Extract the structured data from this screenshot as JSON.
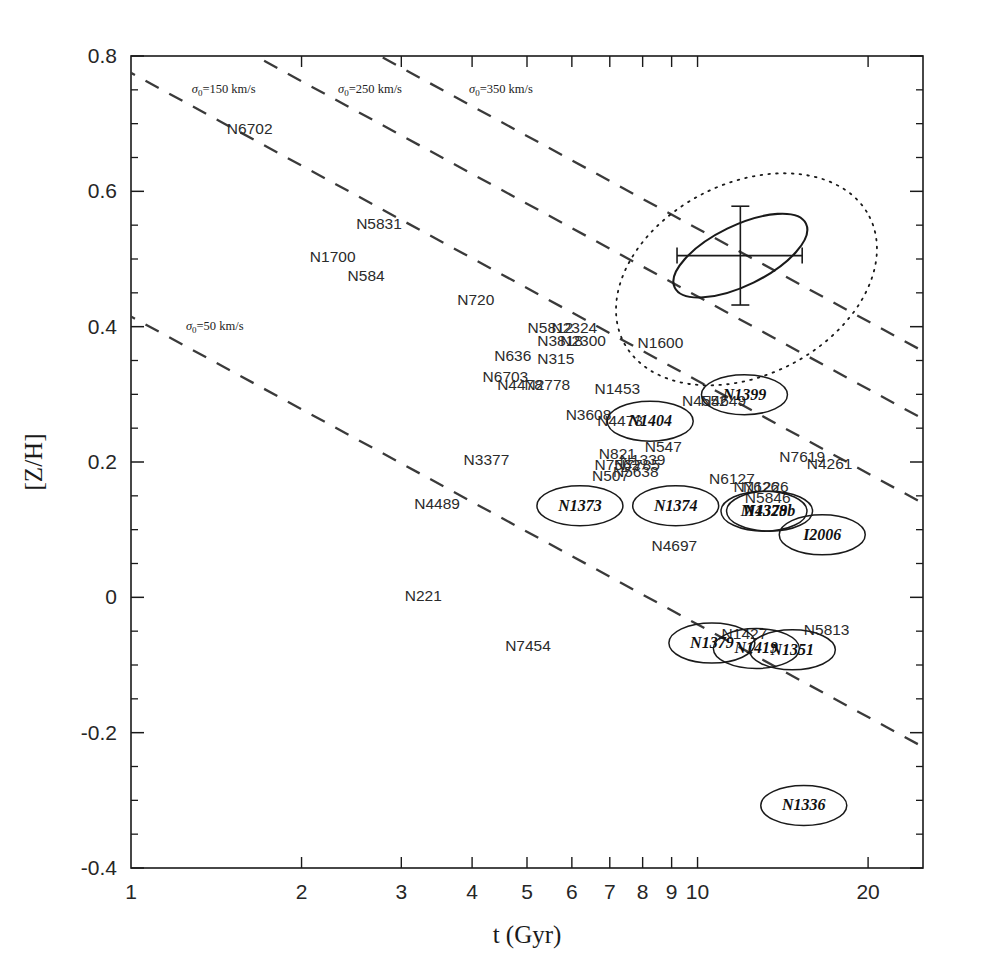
{
  "figure": {
    "domain": "chart",
    "background": "#ffffff",
    "ink": "#1a1a1a"
  },
  "chart_data": {
    "type": "scatter",
    "title": "",
    "xlabel": "t (Gyr)",
    "ylabel": "[Z/H]",
    "xscale": "log",
    "xlim": [
      1,
      25
    ],
    "ylim": [
      -0.4,
      0.8
    ],
    "grid": false,
    "legend": "none",
    "xticks_major": [
      1,
      2,
      3,
      4,
      5,
      6,
      7,
      8,
      9,
      10,
      20
    ],
    "xtick_labels": [
      "1",
      "2",
      "3",
      "4",
      "5",
      "6",
      "7",
      "8",
      "9",
      "10",
      "20"
    ],
    "yticks_major": [
      -0.4,
      -0.2,
      0,
      0.2,
      0.4,
      0.6,
      0.8
    ],
    "ytick_labels": [
      "-0.4",
      "-0.2",
      "0",
      "0.2",
      "0.4",
      "0.6",
      "0.8"
    ],
    "yticks_minor": [
      -0.35,
      -0.3,
      -0.25,
      -0.15,
      -0.1,
      -0.05,
      0.05,
      0.1,
      0.15,
      0.25,
      0.3,
      0.35,
      0.45,
      0.5,
      0.55,
      0.65,
      0.7,
      0.75
    ],
    "sigma_lines": [
      {
        "label": "sigma_0=50 km/s",
        "sigma": 50,
        "text": "=50  km/s",
        "sym": "σ",
        "sub": "0",
        "label_x": 1.25,
        "label_y": 0.395
      },
      {
        "label": "sigma_0=150 km/s",
        "sigma": 150,
        "text": "=150  km/s",
        "sym": "σ",
        "sub": "0",
        "label_x": 1.28,
        "label_y": 0.745
      },
      {
        "label": "sigma_0=250 km/s",
        "sigma": 250,
        "text": "=250  km/s",
        "sym": "σ",
        "sub": "0",
        "label_x": 2.32,
        "label_y": 0.745
      },
      {
        "label": "sigma_0=350 km/s",
        "sigma": 350,
        "text": "=350  km/s",
        "sym": "σ",
        "sub": "0",
        "label_x": 3.95,
        "label_y": 0.745
      }
    ],
    "error_ellipse": {
      "center_x": 11.9,
      "center_y": 0.505,
      "note": "tilted error ellipse with crosshair error bars",
      "x_err_lo": 2.7,
      "x_err_hi": 3.4,
      "y_err": 0.073
    },
    "outer_contour": {
      "note": "dotted outer confidence contour enclosing the error ellipse"
    },
    "points_plain": [
      {
        "label": "N6702",
        "x": 1.62,
        "y": 0.685
      },
      {
        "label": "N5831",
        "x": 2.74,
        "y": 0.545
      },
      {
        "label": "N1700",
        "x": 2.27,
        "y": 0.495
      },
      {
        "label": "N584",
        "x": 2.6,
        "y": 0.468
      },
      {
        "label": "N720",
        "x": 4.06,
        "y": 0.432
      },
      {
        "label": "N5812",
        "x": 5.5,
        "y": 0.39
      },
      {
        "label": "N2324",
        "x": 6.06,
        "y": 0.39
      },
      {
        "label": "N3818",
        "x": 5.72,
        "y": 0.372
      },
      {
        "label": "N2300",
        "x": 6.28,
        "y": 0.372
      },
      {
        "label": "N1600",
        "x": 8.6,
        "y": 0.368
      },
      {
        "label": "N636",
        "x": 4.72,
        "y": 0.35
      },
      {
        "label": "N315",
        "x": 5.62,
        "y": 0.345
      },
      {
        "label": "N6703",
        "x": 4.58,
        "y": 0.318
      },
      {
        "label": "N4478",
        "x": 4.86,
        "y": 0.307
      },
      {
        "label": "N2778",
        "x": 5.43,
        "y": 0.307
      },
      {
        "label": "N1453",
        "x": 7.22,
        "y": 0.3
      },
      {
        "label": "N4552",
        "x": 10.3,
        "y": 0.283
      },
      {
        "label": "N4649",
        "x": 11.1,
        "y": 0.283
      },
      {
        "label": "N3608",
        "x": 6.42,
        "y": 0.262
      },
      {
        "label": "N4473",
        "x": 7.3,
        "y": 0.253
      },
      {
        "label": "N821",
        "x": 7.22,
        "y": 0.205
      },
      {
        "label": "N547",
        "x": 8.7,
        "y": 0.215
      },
      {
        "label": "N1339",
        "x": 8.0,
        "y": 0.195
      },
      {
        "label": "N7562",
        "x": 7.22,
        "y": 0.188
      },
      {
        "label": "N7785",
        "x": 7.82,
        "y": 0.188
      },
      {
        "label": "N507",
        "x": 7.02,
        "y": 0.172
      },
      {
        "label": "N5638",
        "x": 7.78,
        "y": 0.178
      },
      {
        "label": "N3377",
        "x": 4.24,
        "y": 0.196
      },
      {
        "label": "N7619",
        "x": 15.3,
        "y": 0.2
      },
      {
        "label": "N4261",
        "x": 17.1,
        "y": 0.19
      },
      {
        "label": "N6127",
        "x": 11.5,
        "y": 0.168
      },
      {
        "label": "N7626",
        "x": 12.7,
        "y": 0.155
      },
      {
        "label": "N1226",
        "x": 13.2,
        "y": 0.155
      },
      {
        "label": "N5846",
        "x": 13.3,
        "y": 0.14
      },
      {
        "label": "N4489",
        "x": 3.47,
        "y": 0.13
      },
      {
        "label": "N4697",
        "x": 9.1,
        "y": 0.068
      },
      {
        "label": "N221",
        "x": 3.28,
        "y": -0.005
      },
      {
        "label": "N5813",
        "x": 16.9,
        "y": -0.055
      },
      {
        "label": "N7454",
        "x": 5.02,
        "y": -0.08
      },
      {
        "label": "N1427",
        "x": 12.1,
        "y": -0.062
      }
    ],
    "points_ellipse": [
      {
        "label": "N1399",
        "x": 12.1,
        "y": 0.292
      },
      {
        "label": "N1404",
        "x": 8.25,
        "y": 0.253
      },
      {
        "label": "N1373",
        "x": 6.2,
        "y": 0.128
      },
      {
        "label": "N1374",
        "x": 9.15,
        "y": 0.128
      },
      {
        "label": "M4328",
        "x": 13.1,
        "y": 0.12
      },
      {
        "label": "N1379b",
        "x": 13.4,
        "y": 0.12
      },
      {
        "label": "I2006",
        "x": 16.6,
        "y": 0.085
      },
      {
        "label": "N1379",
        "x": 10.6,
        "y": -0.075
      },
      {
        "label": "N1419",
        "x": 12.7,
        "y": -0.083
      },
      {
        "label": "N1351",
        "x": 14.7,
        "y": -0.085
      },
      {
        "label": "N1336",
        "x": 15.4,
        "y": -0.315
      }
    ]
  }
}
